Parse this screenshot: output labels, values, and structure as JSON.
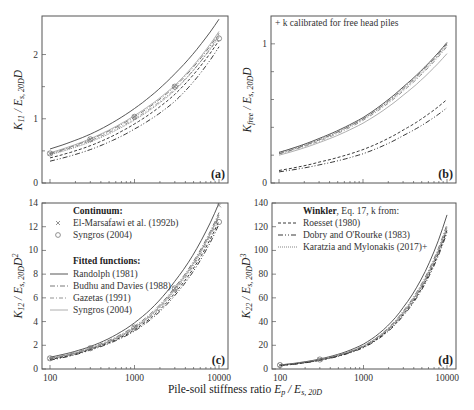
{
  "figure": {
    "x_axis_label_text": "Pile-soil stiffness ratio ",
    "x_axis_label_math": "E_p / E_s,20D",
    "note_b": "+ k calibrated for free head piles"
  },
  "chart_data": [
    {
      "panel": "a",
      "type": "line",
      "panel_label": "(a)",
      "ylabel": "K11 / Es,20D D",
      "xlabel": "Pile-soil stiffness ratio Ep / Es,20D",
      "xscale": "log",
      "xlim": [
        100,
        10000
      ],
      "ylim": [
        0,
        2.6
      ],
      "yticks": [
        0,
        1,
        2
      ],
      "ytick_labels": [
        "0",
        "1",
        "2"
      ],
      "xticks": [
        100,
        1000,
        10000
      ],
      "x": [
        100,
        300,
        1000,
        3000,
        10000
      ],
      "series": [
        {
          "name": "Randolph (1981)",
          "style": "solid",
          "values": [
            0.53,
            0.76,
            1.16,
            1.7,
            2.55
          ]
        },
        {
          "name": "Budhu and Davies (1988)",
          "style": "dashdot",
          "values": [
            0.46,
            0.68,
            1.03,
            1.5,
            2.33
          ]
        },
        {
          "name": "Gazetas (1991)",
          "style": "dashdot2",
          "values": [
            0.45,
            0.66,
            1.0,
            1.46,
            2.27
          ]
        },
        {
          "name": "Syngros (2004)",
          "style": "thin",
          "values": [
            0.47,
            0.69,
            1.05,
            1.52,
            2.36
          ]
        },
        {
          "name": "Roesset (1980)",
          "style": "dashed",
          "values": [
            0.39,
            0.58,
            0.92,
            1.38,
            2.22
          ]
        },
        {
          "name": "Dobry and O'Rourke (1983)",
          "style": "dashdotdot",
          "values": [
            0.34,
            0.52,
            0.84,
            1.27,
            2.12
          ]
        },
        {
          "name": "Karatzia and Mylonakis (2017)+",
          "style": "dotted",
          "values": [
            0.44,
            0.64,
            0.98,
            1.44,
            2.3
          ]
        }
      ],
      "markers": [
        {
          "name": "El-Marsafawi et al. (1992b)",
          "symbol": "x",
          "x": [
            100,
            300,
            1000,
            3000
          ],
          "y": [
            0.46,
            0.68,
            1.03,
            1.5
          ]
        },
        {
          "name": "Syngros (2004)",
          "symbol": "o",
          "x": [
            100,
            300,
            1000,
            3000,
            10000
          ],
          "y": [
            0.46,
            0.68,
            1.03,
            1.5,
            2.25
          ]
        }
      ]
    },
    {
      "panel": "b",
      "type": "line",
      "panel_label": "(b)",
      "ylabel": "Kfree / Es,20D D",
      "xscale": "log",
      "xlim": [
        100,
        10000
      ],
      "ylim": [
        0,
        1.2
      ],
      "yticks": [
        0,
        1
      ],
      "ytick_labels": [
        "0",
        "1"
      ],
      "minor_yticks": [
        0.2,
        0.4,
        0.6,
        0.8
      ],
      "annotation": "+ k calibrated for free head piles",
      "x": [
        100,
        300,
        1000,
        3000,
        10000
      ],
      "series": [
        {
          "name": "Randolph (1981)",
          "style": "solid",
          "values": [
            0.22,
            0.32,
            0.47,
            0.69,
            1.01
          ]
        },
        {
          "name": "Budhu and Davies (1988)",
          "style": "dashdot",
          "values": [
            0.21,
            0.31,
            0.46,
            0.68,
            1.0
          ]
        },
        {
          "name": "Gazetas (1991)",
          "style": "dashdot2",
          "values": [
            0.21,
            0.3,
            0.45,
            0.66,
            0.98
          ]
        },
        {
          "name": "Syngros (2004)",
          "style": "thin",
          "values": [
            0.2,
            0.29,
            0.43,
            0.63,
            0.93
          ]
        },
        {
          "name": "Roesset (1980)",
          "style": "dashed",
          "values": [
            0.09,
            0.15,
            0.24,
            0.38,
            0.6
          ]
        },
        {
          "name": "Dobry and O'Rourke (1983)",
          "style": "dashdotdot",
          "values": [
            0.08,
            0.13,
            0.21,
            0.34,
            0.54
          ]
        },
        {
          "name": "Karatzia and Mylonakis (2017)+",
          "style": "dotted",
          "values": [
            0.22,
            0.31,
            0.46,
            0.67,
            0.99
          ]
        }
      ]
    },
    {
      "panel": "c",
      "type": "line",
      "panel_label": "(c)",
      "ylabel": "K12 / Es,20D D^2",
      "xscale": "log",
      "xlim": [
        100,
        10000
      ],
      "ylim": [
        0,
        14
      ],
      "yticks": [
        0,
        2,
        4,
        6,
        8,
        10,
        12,
        14
      ],
      "ytick_labels": [
        "0",
        "2",
        "4",
        "6",
        "8",
        "10",
        "12",
        "14"
      ],
      "xticks": [
        100,
        1000,
        10000
      ],
      "xtick_labels": [
        "100",
        "1000",
        "10000"
      ],
      "x": [
        100,
        300,
        1000,
        3000,
        10000
      ],
      "series": [
        {
          "name": "Randolph (1981)",
          "style": "solid",
          "values": [
            1.0,
            1.9,
            3.9,
            7.4,
            14.0
          ]
        },
        {
          "name": "Budhu and Davies (1988)",
          "style": "dashdot",
          "values": [
            0.9,
            1.8,
            3.6,
            6.9,
            13.2
          ]
        },
        {
          "name": "Gazetas (1991)",
          "style": "dashdot2",
          "values": [
            0.85,
            1.7,
            3.4,
            6.6,
            12.8
          ]
        },
        {
          "name": "Syngros (2004)",
          "style": "thin",
          "values": [
            0.9,
            1.75,
            3.5,
            6.8,
            13.0
          ]
        },
        {
          "name": "Roesset (1980)",
          "style": "dashed",
          "values": [
            0.8,
            1.65,
            3.3,
            6.4,
            12.5
          ]
        },
        {
          "name": "Dobry and O'Rourke (1983)",
          "style": "dashdotdot",
          "values": [
            0.75,
            1.6,
            3.2,
            6.2,
            12.2
          ]
        },
        {
          "name": "Karatzia and Mylonakis (2017)+",
          "style": "dotted",
          "values": [
            0.85,
            1.7,
            3.45,
            6.7,
            13.0
          ]
        }
      ],
      "markers": [
        {
          "name": "El-Marsafawi et al. (1992b)",
          "symbol": "x",
          "x": [
            100,
            300,
            1000,
            3000,
            10000
          ],
          "y": [
            0.9,
            1.75,
            3.5,
            6.8,
            13.8
          ]
        },
        {
          "name": "Syngros (2004)",
          "symbol": "o",
          "x": [
            100,
            300,
            1000,
            3000,
            10000
          ],
          "y": [
            0.9,
            1.75,
            3.5,
            6.8,
            12.4
          ]
        }
      ],
      "legend": {
        "continuum_title": "Continuum",
        "continuum": [
          {
            "symbol": "x",
            "label": "El-Marsafawi et al. (1992b)"
          },
          {
            "symbol": "o",
            "label": "Syngros (2004)"
          }
        ],
        "fitted_title": "Fitted functions",
        "fitted": [
          {
            "style": "solid",
            "label": "Randolph (1981)"
          },
          {
            "style": "dashdot",
            "label": "Budhu and Davies (1988)"
          },
          {
            "style": "dashdot2",
            "label": "Gazetas (1991)"
          },
          {
            "style": "thin",
            "label": "Syngros (2004)"
          }
        ]
      }
    },
    {
      "panel": "d",
      "type": "line",
      "panel_label": "(d)",
      "ylabel": "K22 / Es,20D D^3",
      "xscale": "log",
      "xlim": [
        100,
        10000
      ],
      "ylim": [
        0,
        140
      ],
      "yticks": [
        0,
        20,
        40,
        60,
        80,
        100,
        120,
        140
      ],
      "ytick_labels": [
        "0",
        "20",
        "40",
        "60",
        "80",
        "100",
        "120",
        "140"
      ],
      "xticks": [
        100,
        1000,
        10000
      ],
      "xtick_labels": [
        "100",
        "1000",
        "10000"
      ],
      "x": [
        100,
        300,
        1000,
        3000,
        10000
      ],
      "series": [
        {
          "name": "Randolph (1981)",
          "style": "solid",
          "values": [
            3.5,
            8.5,
            21,
            52,
            130
          ]
        },
        {
          "name": "Budhu and Davies (1988)",
          "style": "dashdot",
          "values": [
            3.2,
            8.0,
            19.5,
            49,
            122
          ]
        },
        {
          "name": "Gazetas (1991)",
          "style": "dashdot2",
          "values": [
            3.0,
            7.6,
            19,
            47,
            118
          ]
        },
        {
          "name": "Syngros (2004)",
          "style": "thin",
          "values": [
            3.2,
            7.9,
            19.5,
            48,
            120
          ]
        },
        {
          "name": "Roesset (1980)",
          "style": "dashed",
          "values": [
            3.0,
            7.5,
            18.5,
            46,
            117
          ]
        },
        {
          "name": "Dobry and O'Rourke (1983)",
          "style": "dashdotdot",
          "values": [
            2.9,
            7.3,
            18,
            45,
            115
          ]
        },
        {
          "name": "Karatzia and Mylonakis (2017)+",
          "style": "dotted",
          "values": [
            3.1,
            7.8,
            19,
            47.5,
            119
          ]
        }
      ],
      "markers": [
        {
          "name": "El-Marsafawi et al. (1992b)",
          "symbol": "x",
          "x": [
            100,
            300
          ],
          "y": [
            3.3,
            8.0
          ]
        },
        {
          "name": "Syngros (2004)",
          "symbol": "o",
          "x": [
            100,
            300
          ],
          "y": [
            3.3,
            8.0
          ]
        }
      ],
      "legend": {
        "title_bold": "Winkler",
        "title_rest": ", Eq. 17, k from:",
        "items": [
          {
            "style": "dashed",
            "label": "Roesset (1980)"
          },
          {
            "style": "dashdotdot",
            "label": "Dobry and O'Rourke (1983)"
          },
          {
            "style": "dotted",
            "label": "Karatzia and Mylonakis (2017)+"
          }
        ]
      }
    }
  ],
  "line_styles": {
    "solid": {
      "color": "#444444",
      "dash": "",
      "width": 0.9
    },
    "dashdot": {
      "color": "#555555",
      "dash": "5 2 1 2",
      "width": 0.8
    },
    "dashdot2": {
      "color": "#777777",
      "dash": "4 2 1 2",
      "width": 0.8
    },
    "thin": {
      "color": "#999999",
      "dash": "",
      "width": 0.8
    },
    "dashed": {
      "color": "#222222",
      "dash": "3 2",
      "width": 0.9
    },
    "dashdotdot": {
      "color": "#222222",
      "dash": "5 2 1 2 1 2",
      "width": 0.9
    },
    "dotted": {
      "color": "#666666",
      "dash": "1 1",
      "width": 0.8
    }
  }
}
